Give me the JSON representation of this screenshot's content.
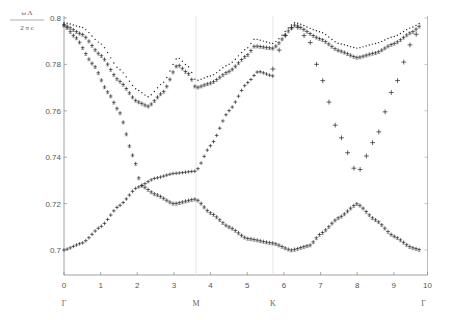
{
  "chart_data": {
    "type": "scatter",
    "title": "",
    "xlabel": "",
    "ylabel_numerator": "ω Λ",
    "ylabel_denominator": "2 π c",
    "xlim": [
      0,
      10
    ],
    "ylim": [
      0.69,
      0.8
    ],
    "grid": false,
    "legend": null,
    "x_ticks": [
      0,
      1,
      2,
      3,
      4,
      5,
      6,
      7,
      8,
      9,
      10
    ],
    "y_ticks": [
      0.7,
      0.72,
      0.74,
      0.76,
      0.78,
      0.8
    ],
    "y_tick_labels": [
      "0.7",
      "0.72",
      "0.74",
      "0.76",
      "0.78",
      "0.8"
    ],
    "symmetry_points": [
      {
        "label": "Γ",
        "x": 0
      },
      {
        "label": "M",
        "x": 3.6
      },
      {
        "label": "K",
        "x": 5.7
      },
      {
        "label": "Γ",
        "x": 9.75
      }
    ],
    "vertical_lines_at": [
      3.6,
      5.7
    ],
    "series": [
      {
        "name": "band-1",
        "marker": "+",
        "x": [
          0,
          0.5,
          1,
          1.5,
          2,
          2.5,
          3,
          3.6,
          4,
          4.5,
          5,
          5.3,
          5.7
        ],
        "y": [
          0.7,
          0.703,
          0.71,
          0.719,
          0.727,
          0.731,
          0.733,
          0.734,
          0.745,
          0.76,
          0.772,
          0.777,
          0.775
        ]
      },
      {
        "name": "band-2",
        "marker": "+",
        "x": [
          5.7,
          6.0,
          6.3,
          6.7,
          7.0,
          7.5,
          8.0,
          8.5,
          9.0,
          9.5,
          9.75
        ],
        "y": [
          0.778,
          0.792,
          0.797,
          0.79,
          0.775,
          0.75,
          0.733,
          0.748,
          0.77,
          0.79,
          0.797
        ]
      },
      {
        "name": "band-3",
        "marker": "+",
        "x": [
          0,
          0.3,
          0.8,
          1.2,
          1.5,
          1.9,
          2.1,
          2.5,
          3.0,
          3.6,
          4.0,
          4.5,
          5.0,
          5.7,
          6.2,
          6.7,
          7.0,
          7.5,
          8.0,
          8.5,
          9.0,
          9.5,
          9.75
        ],
        "y": [
          0.797,
          0.792,
          0.78,
          0.768,
          0.76,
          0.74,
          0.728,
          0.724,
          0.72,
          0.722,
          0.716,
          0.71,
          0.705,
          0.703,
          0.7,
          0.702,
          0.707,
          0.714,
          0.72,
          0.713,
          0.706,
          0.701,
          0.7
        ]
      },
      {
        "name": "band-4",
        "marker": "+",
        "x": [
          0,
          0.5,
          1,
          1.5,
          2.0,
          2.3,
          2.7,
          3.1,
          3.4,
          3.6,
          4.0,
          4.5,
          5.0,
          5.2,
          5.7,
          6.3,
          7.0,
          7.5,
          8.0,
          8.5,
          9.0,
          9.5,
          9.75
        ],
        "y": [
          0.797,
          0.793,
          0.784,
          0.773,
          0.764,
          0.762,
          0.768,
          0.78,
          0.776,
          0.77,
          0.772,
          0.777,
          0.784,
          0.788,
          0.787,
          0.797,
          0.791,
          0.786,
          0.783,
          0.785,
          0.789,
          0.794,
          0.797
        ]
      },
      {
        "name": "band-5",
        "marker": "·",
        "x": [
          0,
          0.5,
          1,
          1.5,
          2.0,
          2.3,
          2.7,
          3.1,
          3.4,
          3.6,
          4.0,
          4.5,
          5.0,
          5.2,
          5.7,
          6.3,
          7.0,
          7.5,
          8.0,
          8.5,
          9.0,
          9.5,
          9.75
        ],
        "y": [
          0.798,
          0.796,
          0.789,
          0.778,
          0.769,
          0.766,
          0.772,
          0.783,
          0.779,
          0.773,
          0.775,
          0.78,
          0.787,
          0.791,
          0.789,
          0.798,
          0.794,
          0.789,
          0.787,
          0.789,
          0.792,
          0.796,
          0.798
        ]
      }
    ]
  },
  "labels": {
    "ylabel_num": "ω Λ",
    "ylabel_den": "2 π c"
  }
}
